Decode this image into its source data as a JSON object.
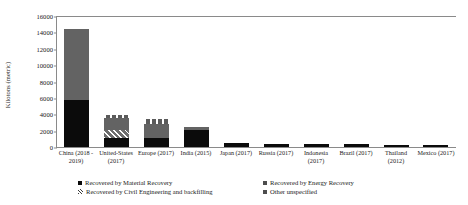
{
  "chart_data": {
    "type": "bar",
    "stacked": true,
    "title": "",
    "xlabel": "",
    "ylabel": "Kilotons (metric)",
    "ylim": [
      0,
      16000
    ],
    "yticks": [
      0,
      2000,
      4000,
      6000,
      8000,
      10000,
      12000,
      14000,
      16000
    ],
    "ytick_labels": [
      "0",
      "2000",
      "4000",
      "6000",
      "8000",
      "10000",
      "12000",
      "14000",
      "16000"
    ],
    "grid": false,
    "legend_position": "bottom",
    "categories": [
      "China (2018 - 2019)",
      "United-States (2017)",
      "Europe (2017)",
      "India (2015)",
      "Japan (2017)",
      "Russia (2017)",
      "Indonesia (2017)",
      "Brazil (2017)",
      "Thailand (2012)",
      "Mexico (2017)"
    ],
    "series": [
      {
        "name": "Recovered by Material Recovery",
        "color": "#0b0b0b",
        "values": [
          5800,
          1150,
          1150,
          2100,
          450,
          400,
          350,
          400,
          250,
          300
        ]
      },
      {
        "name": "Recovered by Civil Engineering and backfilling",
        "color": "#6e6e6e",
        "values": [
          0,
          900,
          0,
          0,
          0,
          0,
          0,
          0,
          0,
          0
        ]
      },
      {
        "name": "Recovered by Energy Recovery",
        "color": "#636363",
        "values": [
          8600,
          1450,
          1700,
          300,
          80,
          0,
          0,
          0,
          0,
          0
        ]
      },
      {
        "name": "Other unspecified",
        "color": "#5a5a5a",
        "values": [
          0,
          400,
          550,
          0,
          0,
          0,
          0,
          0,
          0,
          0
        ]
      }
    ],
    "totals": [
      14400,
      3900,
      3400,
      2400,
      530,
      400,
      350,
      400,
      250,
      300
    ]
  },
  "legend": {
    "items": [
      {
        "label": "Recovered by Material Recovery",
        "marker": "material-swatch"
      },
      {
        "label": "Recovered by Energy Recovery",
        "marker": "energy-swatch"
      },
      {
        "label": "Recovered by Civil Engineering and backfilling",
        "marker": "civil-hatch-swatch"
      },
      {
        "label": "Other unspecified",
        "marker": "other-swatch"
      }
    ]
  }
}
